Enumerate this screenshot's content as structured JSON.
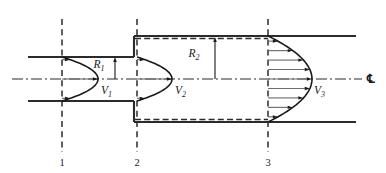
{
  "figure": {
    "kind": "engineering-diagram",
    "background_color": "#ffffff",
    "line_color": "#2b2b2b",
    "arrow_color": "#6e6e6e"
  },
  "labels": {
    "velocity_1": "V",
    "velocity_1_sub": "1",
    "velocity_2": "V",
    "velocity_2_sub": "2",
    "velocity_3": "V",
    "velocity_3_sub": "3",
    "radius_1": "R",
    "radius_1_sub": "1",
    "radius_2": "R",
    "radius_2_sub": "2",
    "centerline_symbol": "℄"
  },
  "stations": [
    {
      "id": "station-1",
      "label": "1",
      "x": 62
    },
    {
      "id": "station-2",
      "label": "2",
      "x": 137
    },
    {
      "id": "station-3",
      "label": "3",
      "x": 268
    }
  ],
  "geometry": {
    "centerline_y": 79,
    "small_pipe_top_y": 57,
    "small_pipe_bottom_y": 101,
    "large_pipe_top_y": 36,
    "large_pipe_bottom_y": 122,
    "small_pipe_left_x": 28,
    "step_x": 134,
    "large_pipe_right_x": 356,
    "centerline_left_x": 12,
    "centerline_right_x": 362
  },
  "dimensions": {
    "R1": {
      "x": 115,
      "from_y": 79,
      "to_y": 57,
      "label_x": 99,
      "label_y": 68
    },
    "R2": {
      "x": 215,
      "from_y": 79,
      "to_y": 37,
      "label_x": 194,
      "label_y": 57
    }
  },
  "profiles": [
    {
      "id": "profile-V1",
      "station": "1",
      "base_x": 62,
      "peak_x": 98,
      "top_y": 57,
      "bottom_y": 101,
      "shape": "parabolic",
      "label_x": 101,
      "label_y": 94
    },
    {
      "id": "profile-V2",
      "station": "2",
      "base_x": 137,
      "peak_x": 172,
      "top_y": 57,
      "bottom_y": 101,
      "shape": "parabolic",
      "label_x": 175,
      "label_y": 94
    },
    {
      "id": "profile-V3",
      "station": "3",
      "base_x": 268,
      "peak_x": 312,
      "top_y": 36,
      "bottom_y": 122,
      "shape": "parabolic",
      "label_x": 314,
      "label_y": 94
    }
  ]
}
